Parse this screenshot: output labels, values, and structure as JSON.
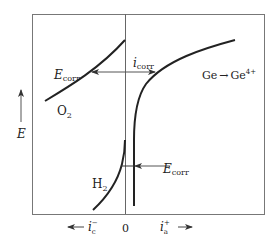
{
  "diagram": {
    "type": "Evans diagram (polarization curves)",
    "axes": {
      "y_label": "E",
      "x_left_label": "i",
      "x_left_sub": "c",
      "x_left_sup": "−",
      "x_zero_label": "0",
      "x_right_label": "i",
      "x_right_sub": "a",
      "x_right_sup": "+"
    },
    "curves": {
      "oxygen": {
        "label": "O",
        "sub": "2"
      },
      "hydrogen": {
        "label": "H",
        "sub": "2"
      },
      "germanium": {
        "label": "Ge",
        "arrow": "→",
        "product": "Ge",
        "product_sup": "4+"
      }
    },
    "annotations": {
      "upper_ecorr": {
        "label": "E",
        "sub": "corr"
      },
      "upper_icorr": {
        "label": "i",
        "sub": "corr"
      },
      "lower_ecorr": {
        "label": "E",
        "sub": "corr"
      }
    },
    "colors": {
      "curve": "#222222",
      "frame": "#777777",
      "arrow": "#555555"
    }
  }
}
